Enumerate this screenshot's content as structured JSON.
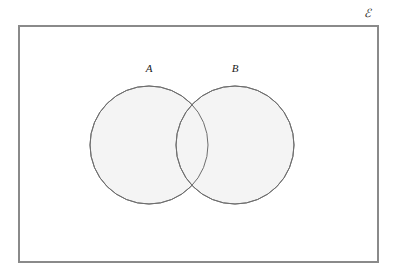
{
  "figure": {
    "type": "venn-diagram",
    "background_color": "#ffffff"
  },
  "universe": {
    "label": "ℰ",
    "label_name": "universal-set-epsilon",
    "fill_color": "#ffffff",
    "stroke_color": "#8a8a8a",
    "stroke_width": 1.2,
    "x": 19,
    "y": 26,
    "width": 359,
    "height": 236,
    "label_x": 367,
    "label_y": 14
  },
  "sets": [
    {
      "label": "A",
      "name": "set-a",
      "cx": 149,
      "cy": 145,
      "r": 59,
      "fill_color": "#f4f4f4",
      "stroke_color": "#6e6e6e",
      "stroke_width": 1.0,
      "label_x": 149,
      "label_y": 68
    },
    {
      "label": "B",
      "name": "set-b",
      "cx": 235,
      "cy": 145,
      "r": 59,
      "fill_color": "#f4f4f4",
      "stroke_color": "#6e6e6e",
      "stroke_width": 1.0,
      "label_x": 235,
      "label_y": 68
    }
  ],
  "intersection": {
    "name": "a-intersect-b",
    "shaded": false,
    "fill_color": "#f4f4f4"
  }
}
